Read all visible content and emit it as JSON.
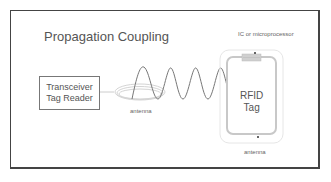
{
  "title": "Propagation Coupling",
  "reader": {
    "line1": "Transceiver",
    "line2": "Tag Reader"
  },
  "labels": {
    "reader_antenna": "antenna",
    "ic": "IC or microprocessor",
    "tag_line1": "RFID",
    "tag_line2": "Tag",
    "tag_antenna": "antenna"
  },
  "colors": {
    "frame": "#444444",
    "text": "#555555",
    "wave": "#777777",
    "tag_outline": "#c8c8c8",
    "chip": "#d0d0d0"
  }
}
